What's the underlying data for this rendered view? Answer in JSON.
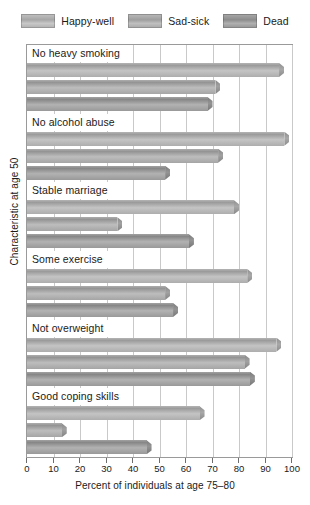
{
  "legend": {
    "position": "top-center",
    "items": [
      {
        "label": "Happy-well",
        "color": "#b0b0b0",
        "swatch_icon": "legend-swatch-icon"
      },
      {
        "label": "Sad-sick",
        "color": "#a8a8a8",
        "swatch_icon": "legend-swatch-icon"
      },
      {
        "label": "Dead",
        "color": "#8f8f8f",
        "swatch_icon": "legend-swatch-icon"
      }
    ]
  },
  "axes": {
    "xtitle": "Percent of individuals at age 75–80",
    "ytitle": "Characteristic at age 50",
    "xticks": [
      "0",
      "10",
      "20",
      "30",
      "40",
      "50",
      "60",
      "70",
      "80",
      "90",
      "100"
    ]
  },
  "chart_data": {
    "type": "bar",
    "orientation": "horizontal",
    "title": "",
    "subtitle": "",
    "xlabel": "Percent of individuals at age 75–80",
    "ylabel": "Characteristic at age 50",
    "xlim": [
      0,
      100
    ],
    "ylim": null,
    "grid": true,
    "legend_position": "top-center",
    "categories": [
      "No heavy smoking",
      "No alcohol abuse",
      "Stable marriage",
      "Some exercise",
      "Not overweight",
      "Good coping skills"
    ],
    "series": [
      {
        "name": "Happy-well",
        "color": "#b0b0b0",
        "values": [
          97,
          99,
          80,
          85,
          96,
          67
        ]
      },
      {
        "name": "Sad-sick",
        "color": "#a8a8a8",
        "values": [
          73,
          74,
          36,
          54,
          84,
          15
        ]
      },
      {
        "name": "Dead",
        "color": "#8f8f8f",
        "values": [
          70,
          54,
          63,
          57,
          86,
          47
        ]
      }
    ]
  }
}
